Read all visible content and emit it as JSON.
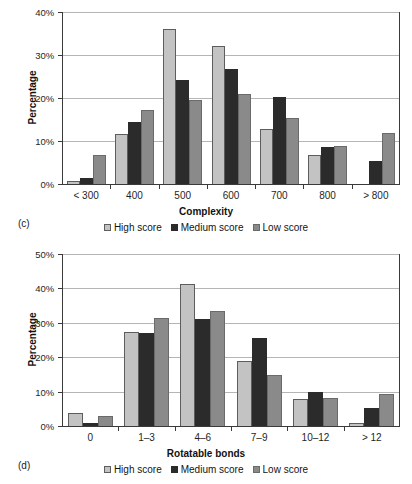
{
  "figure": {
    "panels": [
      {
        "tag": "(c)",
        "legend": [
          {
            "label": "High score",
            "swatch": "s0"
          },
          {
            "label": "Medium score",
            "swatch": "s1"
          },
          {
            "label": "Low score",
            "swatch": "s2"
          }
        ]
      },
      {
        "tag": "(d)",
        "legend": [
          {
            "label": "High score",
            "swatch": "s0"
          },
          {
            "label": "Medium score",
            "swatch": "s1"
          },
          {
            "label": "Low score",
            "swatch": "s2"
          }
        ]
      }
    ],
    "colors": {
      "high_score": "#c3c3c3",
      "medium_score": "#2b2b2b",
      "low_score": "#8a8a8a",
      "gridline": "#b5b5b5",
      "axis": "#3a3a3a"
    }
  },
  "chart_data": [
    {
      "type": "bar",
      "panel": "(c)",
      "title": "",
      "xlabel": "Complexity",
      "ylabel": "Percentage",
      "categories": [
        "< 300",
        "400",
        "500",
        "600",
        "700",
        "800",
        "> 800"
      ],
      "series": [
        {
          "name": "High score",
          "values": [
            0.6,
            11.6,
            36.0,
            32.2,
            12.8,
            6.8,
            0.0
          ]
        },
        {
          "name": "Medium score",
          "values": [
            1.4,
            14.4,
            24.1,
            26.7,
            20.2,
            8.5,
            5.3
          ]
        },
        {
          "name": "Low score",
          "values": [
            6.8,
            17.1,
            19.6,
            20.9,
            15.4,
            8.9,
            11.9
          ]
        }
      ],
      "ylim": [
        0,
        40
      ],
      "yticks": [
        0,
        10,
        20,
        30,
        40
      ],
      "ytick_labels": [
        "0%",
        "10%",
        "20%",
        "30%",
        "40%"
      ],
      "grid": "horizontal",
      "legend_position": "bottom"
    },
    {
      "type": "bar",
      "panel": "(d)",
      "title": "",
      "xlabel": "Rotatable bonds",
      "ylabel": "Percentage",
      "categories": [
        "0",
        "1–3",
        "4–6",
        "7–9",
        "10–12",
        "> 12"
      ],
      "series": [
        {
          "name": "High score",
          "values": [
            3.8,
            27.2,
            41.3,
            18.8,
            7.8,
            1.0
          ]
        },
        {
          "name": "Medium score",
          "values": [
            0.9,
            27.0,
            31.2,
            25.5,
            9.9,
            5.2
          ]
        },
        {
          "name": "Low score",
          "values": [
            2.9,
            31.3,
            33.5,
            14.8,
            8.0,
            9.3
          ]
        }
      ],
      "ylim": [
        0,
        50
      ],
      "yticks": [
        0,
        10,
        20,
        30,
        40,
        50
      ],
      "ytick_labels": [
        "0%",
        "10%",
        "20%",
        "30%",
        "40%",
        "50%"
      ],
      "grid": "horizontal",
      "legend_position": "bottom"
    }
  ]
}
